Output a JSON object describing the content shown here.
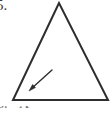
{
  "figure": {
    "problem_number": "5.",
    "background_color": "#ffffff",
    "stroke_color": "#2e2e2e",
    "stroke_width": 2,
    "width": 112,
    "height": 114,
    "shape": {
      "name": "triangle",
      "type": "isosceles-triangle",
      "vertices": [
        {
          "label": "apex",
          "x": 59,
          "y": 3
        },
        {
          "label": "bottom-left",
          "x": 13,
          "y": 100
        },
        {
          "label": "bottom-right",
          "x": 108,
          "y": 100
        }
      ],
      "points_attr": "59,3 13,100 108,100"
    },
    "arrow": {
      "name": "pointer-arrow",
      "tail": {
        "x": 52,
        "y": 70
      },
      "tip": {
        "x": 29,
        "y": 91
      },
      "head_size": 5,
      "stroke_width": 1.4,
      "points_to": "left side of triangle"
    }
  },
  "clipped_text": {
    "fragment_a": "6.",
    "fragment_b": "A"
  }
}
